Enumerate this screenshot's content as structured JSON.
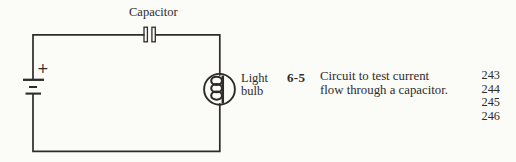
{
  "diagram": {
    "capacitor_label": "Capacitor",
    "battery_polarity": "+",
    "bulb_label_line1": "Light",
    "bulb_label_line2": "bulb"
  },
  "figure_entry": {
    "number": "6-5",
    "caption_line1": "Circuit to test current",
    "caption_line2": "flow through a capacitor.",
    "pages": [
      "243",
      "244",
      "245",
      "246"
    ]
  },
  "colors": {
    "ink": "#2e2c2a",
    "background": "#fbfbf8"
  }
}
